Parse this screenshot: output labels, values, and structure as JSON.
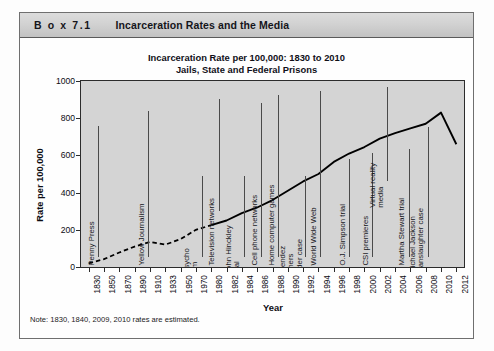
{
  "box": {
    "label": "B o x  7.1",
    "title": "Incarceration Rates and the Media"
  },
  "note": "Note: 1830, 1840, 2009, 2010 rates are estimated.",
  "chart_data": {
    "type": "line",
    "title_line1": "Incarceration Rate per 100,000: 1830 to 2010",
    "title_line2": "Jails, State and Federal Prisons",
    "xlabel": "Year",
    "ylabel": "Rate per 100,000",
    "ylim": [
      0,
      1000
    ],
    "yticks": [
      0,
      200,
      400,
      600,
      800,
      1000
    ],
    "grid": false,
    "legend": "none",
    "categories": [
      "1830",
      "1850",
      "1870",
      "1890",
      "1910",
      "1933",
      "1950",
      "1970",
      "1980",
      "1982",
      "1984",
      "1986",
      "1988",
      "1990",
      "1992",
      "1994",
      "1996",
      "1998",
      "2000",
      "2002",
      "2004",
      "2006",
      "2008",
      "2010",
      "2012"
    ],
    "series": [
      {
        "name": "Incarceration rate per 100,000",
        "style_estimated_segment": "dashed 1830-1980",
        "values": [
          20,
          42,
          78,
          110,
          135,
          120,
          150,
          200,
          225,
          250,
          290,
          320,
          360,
          410,
          460,
          500,
          565,
          610,
          645,
          690,
          720,
          745,
          770,
          830,
          660
        ]
      }
    ],
    "annotations": [
      {
        "label": "Penny Press",
        "year": "1830"
      },
      {
        "label": "Yellow Journalism",
        "year": "1890"
      },
      {
        "label": "Psycho film",
        "year": "1960"
      },
      {
        "label": "Television networks",
        "year": "1950"
      },
      {
        "label": "John Hinckley trial",
        "year": "1982"
      },
      {
        "label": "Cell phone networks",
        "year": "1984"
      },
      {
        "label": "Home computer games",
        "year": "1986"
      },
      {
        "label": "Menendez brothers murder case",
        "year": "1989"
      },
      {
        "label": "World Wide Web",
        "year": "1991"
      },
      {
        "label": "O.J. Simpson trial",
        "year": "1995"
      },
      {
        "label": "CSI premieres",
        "year": "2000"
      },
      {
        "label": "Virtual reality media",
        "year": "2002"
      },
      {
        "label": "Martha Stewart trial",
        "year": "2004"
      },
      {
        "label": "Michael Jackson manslaughter case",
        "year": "2009"
      }
    ],
    "colors": {
      "plot_background": "#d4d4d4",
      "line": "#000000",
      "axis": "#2c2c2c",
      "annotation_rule": "#4a4a4a"
    }
  }
}
